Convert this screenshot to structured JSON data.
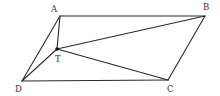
{
  "diagram": {
    "type": "geometry",
    "points": {
      "A": {
        "label": "A",
        "x": 60,
        "y": 16,
        "lx": 51,
        "ly": 12
      },
      "B": {
        "label": "B",
        "x": 205,
        "y": 16,
        "lx": 203,
        "ly": 10
      },
      "C": {
        "label": "C",
        "x": 168,
        "y": 80,
        "lx": 167,
        "ly": 92
      },
      "D": {
        "label": "D",
        "x": 22,
        "y": 81,
        "lx": 15,
        "ly": 92
      },
      "T": {
        "label": "T",
        "x": 57,
        "y": 49,
        "lx": 55,
        "ly": 62
      }
    },
    "edges": [
      [
        "A",
        "B"
      ],
      [
        "B",
        "C"
      ],
      [
        "C",
        "D"
      ],
      [
        "D",
        "A"
      ],
      [
        "T",
        "A"
      ],
      [
        "T",
        "B"
      ],
      [
        "T",
        "C"
      ],
      [
        "T",
        "D"
      ]
    ],
    "colors": {
      "line": "#2a2a2a",
      "label": "#333333",
      "background": "#ffffff"
    }
  }
}
